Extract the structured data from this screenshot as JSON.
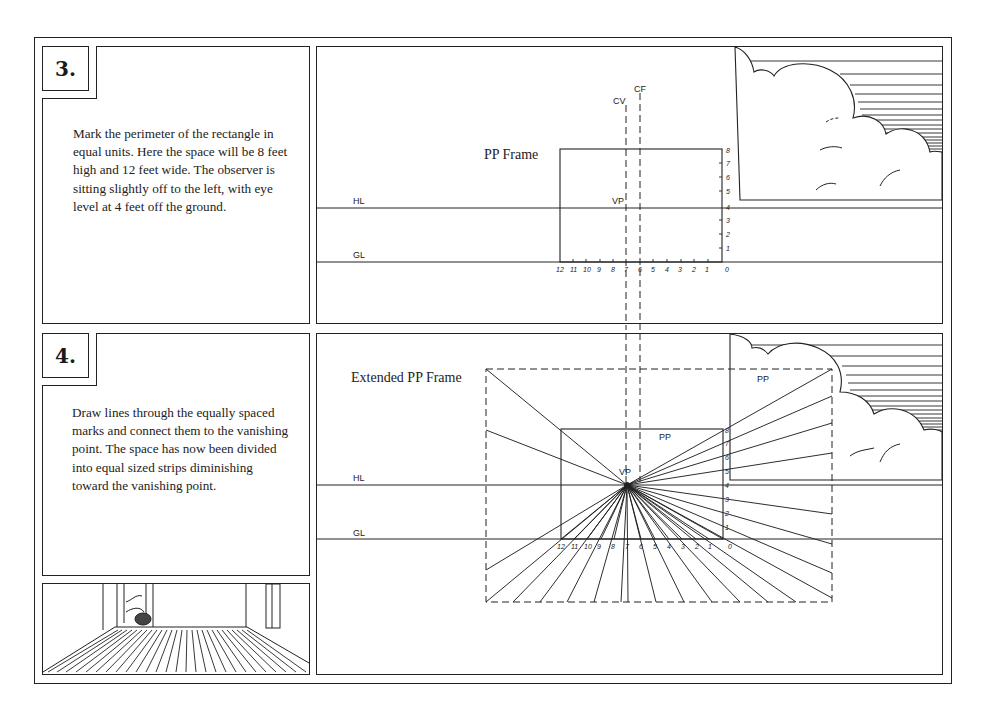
{
  "steps": [
    {
      "number": "3.",
      "text": "Mark the perimeter of the rectangle in equal units. Here the space will be 8 feet high and 12 feet wide. The observer is sitting slightly off to the left, with eye level at 4 feet off the ground.",
      "diagram": {
        "frame_label": "PP Frame",
        "horizon_label": "HL",
        "ground_label": "GL",
        "cv_label": "CV",
        "cf_label": "CF",
        "vp_label": "VP",
        "bottom_ticks": [
          "12",
          "11",
          "10",
          "9",
          "8",
          "7",
          "6",
          "5",
          "4",
          "3",
          "2",
          "1",
          "0"
        ],
        "side_ticks": [
          "8",
          "7",
          "6",
          "5",
          "4",
          "3",
          "2",
          "1"
        ]
      }
    },
    {
      "number": "4.",
      "text": "Draw lines through the equally spaced marks and connect them to the vanishing point. The space has now been divided into equal sized strips diminishing toward the vanishing point.",
      "diagram": {
        "frame_label": "Extended PP Frame",
        "horizon_label": "HL",
        "ground_label": "GL",
        "vp_label": "VP",
        "pp_inner_label": "PP",
        "pp_outer_label": "PP",
        "bottom_ticks": [
          "12",
          "11",
          "10",
          "9",
          "8",
          "7",
          "6",
          "5",
          "4",
          "3",
          "2",
          "1",
          "0"
        ],
        "side_ticks": [
          "8",
          "7",
          "6",
          "5",
          "4",
          "3",
          "2",
          "1"
        ]
      }
    }
  ],
  "illustration": {
    "subject": "room-interior-with-striped-floor"
  }
}
